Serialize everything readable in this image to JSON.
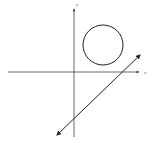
{
  "diagram": {
    "axes": {
      "x_label": "x",
      "y_label": "y",
      "color": "#444444"
    },
    "circle": {
      "cx": 103,
      "cy": 45,
      "r": 20,
      "stroke": "#222222"
    },
    "line": {
      "x1": 56,
      "y1": 136,
      "x2": 141,
      "y2": 54,
      "stroke": "#222222",
      "arrows": "both"
    }
  }
}
